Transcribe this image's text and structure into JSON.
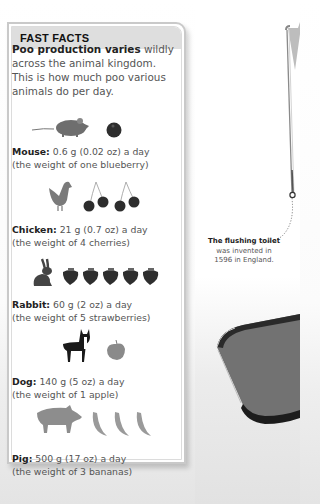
{
  "sidebar_box": {
    "title": "FAST FACTS",
    "intro_bold": "Poo production varies",
    "intro_rest": " wildly across the animal kingdom. This is how much poo various animals do per day.",
    "facts": [
      {
        "animal": "Mouse:",
        "amount": " 0.6 g (0.02 oz) a day",
        "comparison": "(the weight of one blueberry)",
        "animal_icon": "mouse-icon",
        "food_icon": "blueberry-icon",
        "food_count": 1
      },
      {
        "animal": "Chicken:",
        "amount": " 21 g (0.7 oz) a day",
        "comparison": "(the weight of 4 cherries)",
        "animal_icon": "chicken-icon",
        "food_icon": "cherry-icon",
        "food_count": 4
      },
      {
        "animal": "Rabbit:",
        "amount": " 60 g (2 oz) a day",
        "comparison": "(the weight of 5 strawberries)",
        "animal_icon": "rabbit-icon",
        "food_icon": "strawberry-icon",
        "food_count": 5
      },
      {
        "animal": "Dog:",
        "amount": " 140 g (5 oz) a day",
        "comparison": "(the weight of 1 apple)",
        "animal_icon": "dog-icon",
        "food_icon": "apple-icon",
        "food_count": 1
      },
      {
        "animal": "Pig:",
        "amount": " 500 g (17 oz) a day",
        "comparison": "(the weight of 3 bananas)",
        "animal_icon": "pig-icon",
        "food_icon": "banana-icon",
        "food_count": 3
      }
    ]
  },
  "callout": {
    "bold": "The flushing toilet",
    "line2": "was invented in",
    "line3": "1596 in England."
  },
  "colors": {
    "box_border": "#c9c9c9",
    "header_bg": "#dedede",
    "body_text": "#555555",
    "bold_text": "#222222"
  }
}
